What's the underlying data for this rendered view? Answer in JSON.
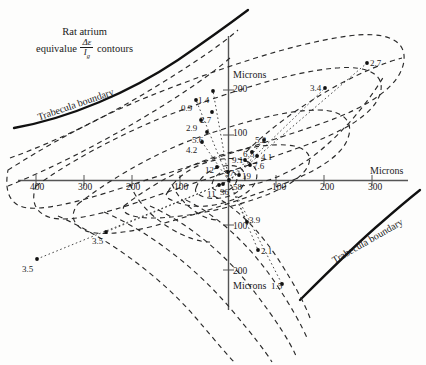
{
  "figure": {
    "title_line1": "Rat atrium",
    "title_line2_pre": "equivalue",
    "title_numerator": "Δε",
    "title_denominator": "I",
    "title_denominator_sub": "g",
    "title_line2_post": "contours",
    "boundary_label_top": "Trabecula boundary",
    "boundary_label_bottom": "Trabecula boundary",
    "axis_unit_right": "Microns",
    "axis_unit_top": "Microns",
    "axis_unit_bottom": "Microns"
  },
  "axes": {
    "x_ticks_left": [
      "400",
      "300",
      "200",
      "100"
    ],
    "x_ticks_right": [
      "100",
      "200",
      "300"
    ],
    "y_ticks_up": [
      "200",
      "100"
    ],
    "y_ticks_down": [
      "100",
      "200"
    ]
  },
  "chart_data": {
    "type": "scatter",
    "xlabel": "Microns",
    "ylabel": "Microns",
    "xlim": [
      -420,
      330
    ],
    "ylim": [
      -230,
      250
    ],
    "grid": false,
    "legend": null,
    "annotations": [
      "Trabecula boundary (upper left)",
      "Trabecula boundary (lower right)"
    ],
    "labels": [
      {
        "text": "1.4",
        "x": 198,
        "y": 96
      },
      {
        "text": "0.9",
        "x": 181,
        "y": 104
      },
      {
        "text": "2.7",
        "x": 200,
        "y": 116
      },
      {
        "text": "2.9",
        "x": 186,
        "y": 124
      },
      {
        "text": "5.6",
        "x": 192,
        "y": 136
      },
      {
        "text": "4.2",
        "x": 186,
        "y": 146
      },
      {
        "text": "12",
        "x": 205,
        "y": 166
      },
      {
        "text": "37",
        "x": 225,
        "y": 169
      },
      {
        "text": "58",
        "x": 233,
        "y": 183
      },
      {
        "text": "11",
        "x": 207,
        "y": 190
      },
      {
        "text": "36",
        "x": 220,
        "y": 188
      },
      {
        "text": "19",
        "x": 242,
        "y": 172
      },
      {
        "text": "9.1",
        "x": 232,
        "y": 156
      },
      {
        "text": "7.6",
        "x": 253,
        "y": 162
      },
      {
        "text": "6.5",
        "x": 243,
        "y": 150
      },
      {
        "text": "4.1",
        "x": 261,
        "y": 153
      },
      {
        "text": "5.2",
        "x": 255,
        "y": 136
      },
      {
        "text": "3.4",
        "x": 310,
        "y": 84
      },
      {
        "text": "2.7",
        "x": 370,
        "y": 59
      },
      {
        "text": "3.9",
        "x": 249,
        "y": 216
      },
      {
        "text": "2.1",
        "x": 261,
        "y": 247
      },
      {
        "text": "1.5",
        "x": 271,
        "y": 282
      },
      {
        "text": "3.5",
        "x": 92,
        "y": 237
      },
      {
        "text": "3.5",
        "x": 22,
        "y": 265
      }
    ],
    "points": [
      {
        "value": 1.4,
        "x": 213,
        "y": 91
      },
      {
        "value": 0.9,
        "x": 196,
        "y": 100
      },
      {
        "value": 2.7,
        "x": 212,
        "y": 112
      },
      {
        "value": 2.9,
        "x": 201,
        "y": 120
      },
      {
        "value": 5.6,
        "x": 207,
        "y": 132
      },
      {
        "value": 4.2,
        "x": 202,
        "y": 142
      },
      {
        "value": 12,
        "x": 217,
        "y": 167
      },
      {
        "value": 37,
        "x": 228,
        "y": 172
      },
      {
        "value": 58,
        "x": 229,
        "y": 180
      },
      {
        "value": 11,
        "x": 219,
        "y": 185
      },
      {
        "value": 36,
        "x": 223,
        "y": 184
      },
      {
        "value": 19,
        "x": 239,
        "y": 175
      },
      {
        "value": 9.1,
        "x": 245,
        "y": 160
      },
      {
        "value": 7.6,
        "x": 250,
        "y": 165
      },
      {
        "value": 6.5,
        "x": 252,
        "y": 152
      },
      {
        "value": 4.1,
        "x": 257,
        "y": 156
      },
      {
        "value": 5.2,
        "x": 264,
        "y": 140
      },
      {
        "value": 3.4,
        "x": 325,
        "y": 88
      },
      {
        "value": 2.7,
        "x": 367,
        "y": 63
      },
      {
        "value": 3.9,
        "x": 247,
        "y": 222
      },
      {
        "value": 2.1,
        "x": 258,
        "y": 250
      },
      {
        "value": 1.5,
        "x": 282,
        "y": 284
      },
      {
        "value": 3.5,
        "x": 106,
        "y": 232
      },
      {
        "value": 3.5,
        "x": 37,
        "y": 259
      }
    ]
  }
}
